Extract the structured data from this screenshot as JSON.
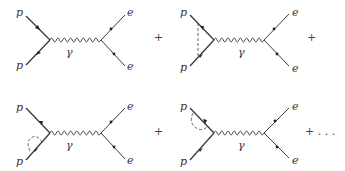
{
  "figure": {
    "diagrams": [
      {
        "id": "tree",
        "incoming": [
          "p",
          "p"
        ],
        "propagator": "γ",
        "outgoing": [
          "e",
          "e"
        ],
        "correction": "none",
        "operator": "+"
      },
      {
        "id": "vertex-correction",
        "incoming": [
          "p",
          "p"
        ],
        "propagator": "γ",
        "outgoing": [
          "e",
          "e"
        ],
        "correction": "dashed exchange between incoming lines",
        "operator": "+"
      },
      {
        "id": "self-energy-lower",
        "incoming": [
          "p",
          "p"
        ],
        "propagator": "γ",
        "outgoing": [
          "e",
          "e"
        ],
        "correction": "dashed loop on lower incoming line",
        "operator": "+"
      },
      {
        "id": "self-energy-upper",
        "incoming": [
          "p",
          "p"
        ],
        "propagator": "γ",
        "outgoing": [
          "e",
          "e"
        ],
        "correction": "dashed loop on upper incoming line",
        "operator": "+ . . ."
      }
    ]
  }
}
